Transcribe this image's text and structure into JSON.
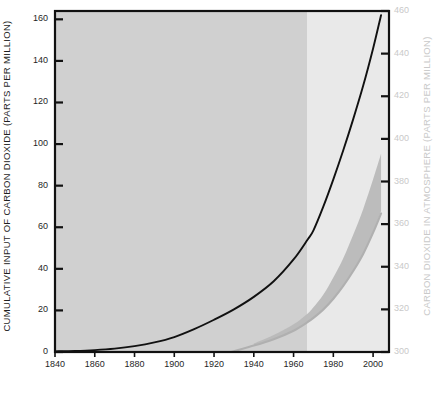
{
  "chart_data": {
    "type": "line",
    "title": "",
    "xlabel": "YEAR",
    "ylabel": "CUMULATIVE INPUT OF CARBON DIOXIDE (PARTS PER MILLION)",
    "y2label": "CARBON DIOXIDE IN ATMOSPHERE (PARTS PER MILLION)",
    "xlim": [
      1840,
      2008
    ],
    "ylim": [
      0,
      164
    ],
    "y2lim": [
      300,
      460
    ],
    "grid": false,
    "legend": "none",
    "xticks": [
      1840,
      1860,
      1880,
      1900,
      1920,
      1940,
      1960,
      1980,
      2000
    ],
    "xtick_labels": [
      "1840",
      "1860",
      "1880",
      "1900",
      "1920",
      "1940",
      "1960",
      "1980",
      "2000"
    ],
    "yticks": [
      0,
      20,
      40,
      60,
      80,
      100,
      120,
      140,
      160
    ],
    "ytick_labels": [
      "0",
      "20",
      "40",
      "60",
      "80",
      "100",
      "120",
      "140",
      "160"
    ],
    "y2ticks": [
      300,
      320,
      340,
      360,
      380,
      400,
      420,
      440,
      460
    ],
    "y2tick_labels": [
      "300",
      "320",
      "340",
      "360",
      "380",
      "400",
      "420",
      "440",
      "460"
    ],
    "shaded_regions": [
      {
        "name": "historical-record",
        "x_start": 1840,
        "x_end": 1967,
        "color": "#d0d0d0"
      },
      {
        "name": "projection",
        "x_start": 1967,
        "x_end": 2008,
        "color": "#e9e9e9"
      }
    ],
    "series": [
      {
        "name": "Cumulative input of carbon dioxide",
        "axis": "left",
        "color": "#111111",
        "x": [
          1840,
          1850,
          1860,
          1870,
          1880,
          1890,
          1900,
          1910,
          1920,
          1930,
          1940,
          1950,
          1960,
          1967,
          1970,
          1975,
          1980,
          1985,
          1990,
          1995,
          2000,
          2004
        ],
        "values": [
          0.3,
          0.5,
          0.9,
          1.6,
          2.8,
          4.6,
          7.2,
          11.0,
          15.5,
          20.5,
          26.5,
          34.0,
          44.5,
          54.0,
          58.5,
          70.0,
          83.0,
          97.0,
          112.0,
          128.0,
          146.0,
          162.0
        ]
      },
      {
        "name": "Carbon dioxide in atmosphere (central estimate)",
        "axis": "right",
        "color": "#b0b0b0",
        "x": [
          1840,
          1860,
          1880,
          1900,
          1920,
          1940,
          1950,
          1960,
          1967,
          1970,
          1975,
          1980,
          1985,
          1990,
          1995,
          2000,
          2004
        ],
        "values": [
          291,
          292,
          293,
          295,
          298,
          303,
          306,
          310,
          314,
          316,
          320,
          325,
          331,
          338,
          346,
          356,
          365
        ]
      },
      {
        "name": "Carbon dioxide in atmosphere (uncertainty band upper)",
        "axis": "right",
        "color": "#b5b5b5",
        "x": [
          1940,
          1950,
          1960,
          1967,
          1970,
          1975,
          1980,
          1985,
          1990,
          1995,
          2000,
          2004
        ],
        "values": [
          304,
          308,
          313,
          318,
          321,
          327,
          335,
          344,
          355,
          367,
          381,
          393
        ]
      },
      {
        "name": "Carbon dioxide in atmosphere (uncertainty band lower)",
        "axis": "right",
        "color": "#b5b5b5",
        "x": [
          1940,
          1950,
          1960,
          1967,
          1970,
          1975,
          1980,
          1985,
          1990,
          1995,
          2000,
          2004
        ],
        "values": [
          303,
          306,
          310,
          314,
          316,
          320,
          325,
          331,
          338,
          346,
          356,
          366
        ]
      }
    ]
  },
  "colors": {
    "frame": "#111111",
    "left_text": "#1f1f1f",
    "right_text": "#c9c9c9",
    "curve_black": "#111111",
    "curve_gray": "#b0b0b0",
    "band_fill": "#b9b9b9",
    "region_dark": "#d0d0d0",
    "region_light": "#e9e9e9",
    "page_background": "#ffffff"
  }
}
